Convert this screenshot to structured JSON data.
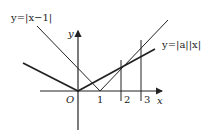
{
  "diagram": {
    "type": "function-graph",
    "labels": {
      "curve1": "y=|x−1|",
      "curve2": "y=|a||x|",
      "y_axis": "y",
      "x_axis": "x",
      "origin": "O",
      "tick1": "1",
      "tick2": "2",
      "tick3": "3"
    },
    "curves": [
      {
        "name": "y=|x-1|",
        "vertex": [
          1,
          0
        ],
        "style": "thin"
      },
      {
        "name": "y=|a||x|",
        "vertex": [
          0,
          0
        ],
        "style": "thick"
      }
    ],
    "vertical_lines_at_x": [
      2,
      3
    ],
    "colors": {
      "line": "#222222",
      "background": "#ffffff"
    }
  }
}
